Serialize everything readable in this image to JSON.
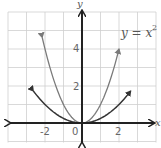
{
  "chart_data": {
    "type": "line",
    "title": "",
    "xlabel": "x",
    "ylabel": "y",
    "xlim": [
      -4,
      4
    ],
    "ylim": [
      -1,
      6
    ],
    "grid": true,
    "x_ticks": [
      -2,
      0,
      2
    ],
    "x_tick_labels": [
      "-2",
      "0",
      "2"
    ],
    "y_ticks": [
      2,
      4
    ],
    "y_tick_labels": [
      "2",
      "4"
    ],
    "series": [
      {
        "name": "y = x^2",
        "color": "#7a7a7a",
        "equation": "y = x^2",
        "x_range": [
          -2.15,
          2.0
        ],
        "x": [
          -2.15,
          -2,
          -1.5,
          -1,
          -0.5,
          0,
          0.5,
          1,
          1.5,
          2
        ],
        "y": [
          4.62,
          4,
          2.25,
          1,
          0.25,
          0,
          0.25,
          1,
          2.25,
          4
        ],
        "arrows_both_ends": true
      },
      {
        "name": "wider parabola (approx. y = x^2/4)",
        "color": "#333333",
        "equation": "y = 0.25x^2",
        "x_range": [
          -2.63,
          2.63
        ],
        "x": [
          -2.63,
          -2,
          -1,
          0,
          1,
          2,
          2.63
        ],
        "y": [
          1.73,
          1,
          0.25,
          0,
          0.25,
          1,
          1.73
        ],
        "arrows_both_ends": true
      }
    ],
    "annotations": [
      {
        "text": "y = x",
        "superscript": "2",
        "near_series": "y = x^2"
      }
    ]
  },
  "labels": {
    "x_axis": "x",
    "y_axis": "y",
    "tick_neg2": "-2",
    "tick_0": "0",
    "tick_2": "2",
    "tick_y2": "2",
    "tick_y4": "4",
    "equation_main": "y = x",
    "equation_sup": "2"
  },
  "colors": {
    "grid": "#cfcfcf",
    "axis": "#222222",
    "curve_narrow": "#7a7a7a",
    "curve_wide": "#333333"
  }
}
